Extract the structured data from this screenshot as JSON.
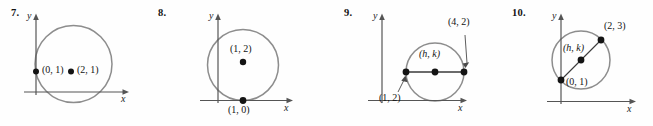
{
  "page": {
    "kind": "textbook-exercise-figures",
    "stroke_colors": {
      "circle": "#8d8d8d",
      "axis": "#555555",
      "chord": "#3a3a3a",
      "dot": "#141414",
      "leader": "#4a4a4a"
    },
    "background": "#fefefe"
  },
  "figures": [
    {
      "number": "7.",
      "y_axis_label": "y",
      "x_axis_label": "x",
      "points": [
        {
          "label": "(0, 1)",
          "italic": false
        },
        {
          "label": "(2, 1)",
          "italic": false
        }
      ]
    },
    {
      "number": "8.",
      "y_axis_label": "y",
      "x_axis_label": "x",
      "points": [
        {
          "label": "(1, 2)",
          "italic": false
        },
        {
          "label": "(1, 0)",
          "italic": false
        }
      ]
    },
    {
      "number": "9.",
      "y_axis_label": "y",
      "x_axis_label": "x",
      "points": [
        {
          "label": "(4, 2)",
          "italic": false
        },
        {
          "label": "(h, k)",
          "italic": true
        },
        {
          "label": "(1, 2)",
          "italic": false
        }
      ]
    },
    {
      "number": "10.",
      "y_axis_label": "y",
      "x_axis_label": "x",
      "points": [
        {
          "label": "(2, 3)",
          "italic": false
        },
        {
          "label": "(h, k)",
          "italic": true
        },
        {
          "label": "(0, 1)",
          "italic": false
        }
      ]
    }
  ]
}
